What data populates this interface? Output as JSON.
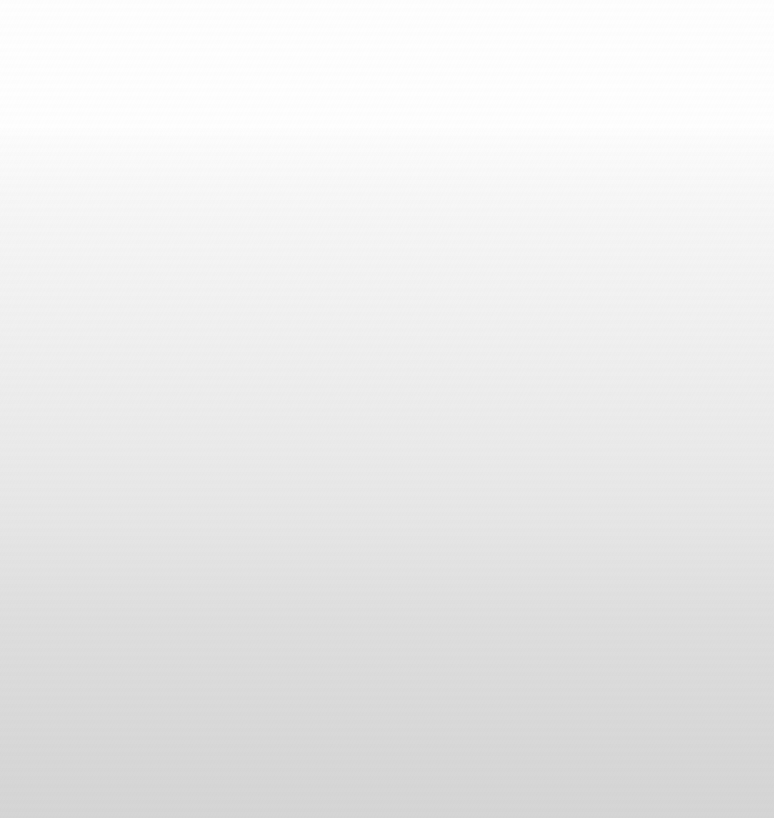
{
  "viewport": {
    "width": 774,
    "height": 818,
    "description": "blank-canvas"
  },
  "canvas": {
    "state_label": "",
    "empty_state_message": "",
    "has_text": false,
    "has_icons": false,
    "has_controls": false
  },
  "background": {
    "type": "linear-gradient",
    "direction": "to-bottom",
    "top_color": "#fefefe",
    "bottom_color": "#d5d5d5",
    "plateau_end_y": 130,
    "ramp_onset_y": 133,
    "stops": [
      {
        "y": 0,
        "color": "#fefefe"
      },
      {
        "y": 128,
        "color": "#fefefe"
      },
      {
        "y": 136,
        "color": "#fcfcfc"
      },
      {
        "y": 170,
        "color": "#f9f9f9"
      },
      {
        "y": 210,
        "color": "#f6f6f6"
      },
      {
        "y": 290,
        "color": "#f2f2f2"
      },
      {
        "y": 370,
        "color": "#eeeeee"
      },
      {
        "y": 450,
        "color": "#eaeaea"
      },
      {
        "y": 520,
        "color": "#e6e6e6"
      },
      {
        "y": 570,
        "color": "#e2e2e2"
      },
      {
        "y": 620,
        "color": "#dedede"
      },
      {
        "y": 700,
        "color": "#dadada"
      },
      {
        "y": 760,
        "color": "#d7d7d7"
      },
      {
        "y": 818,
        "color": "#d5d5d5"
      }
    ]
  },
  "artifacts": {
    "jpeg_block_banding": true,
    "block_size_px": 8,
    "luminance_noise": true
  }
}
